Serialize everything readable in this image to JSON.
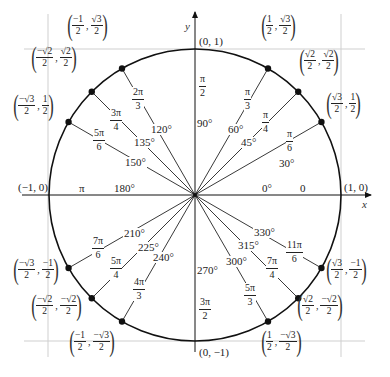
{
  "diagram": {
    "axes": {
      "x_label": "x",
      "y_label": "y"
    },
    "colors": {
      "stroke": "#111111",
      "guide": "#c8c8c8",
      "text": "#222222"
    },
    "geometry": {
      "center": [
        195,
        195
      ],
      "radius": 146
    },
    "axis_points": [
      {
        "id": "pos-x",
        "text": "(1, 0)"
      },
      {
        "id": "pos-y",
        "text": "(0, 1)"
      },
      {
        "id": "neg-x",
        "text": "(−1, 0)"
      },
      {
        "id": "neg-y",
        "text": "(0, −1)"
      }
    ],
    "axis_angles": [
      {
        "deg": "0°",
        "rad": "0"
      },
      {
        "deg": "90°",
        "rad_num": "π",
        "rad_den": "2"
      },
      {
        "deg": "180°",
        "rad": "π"
      },
      {
        "deg": "270°",
        "rad_num": "3π",
        "rad_den": "2"
      }
    ],
    "points": [
      {
        "deg": "30°",
        "rad_num": "π",
        "rad_den": "6",
        "x_num": "√3",
        "x_den": "2",
        "y_num": "1",
        "y_den": "2"
      },
      {
        "deg": "45°",
        "rad_num": "π",
        "rad_den": "4",
        "x_num": "√2",
        "x_den": "2",
        "y_num": "√2",
        "y_den": "2"
      },
      {
        "deg": "60°",
        "rad_num": "π",
        "rad_den": "3",
        "x_num": "1",
        "x_den": "2",
        "y_num": "√3",
        "y_den": "2"
      },
      {
        "deg": "120°",
        "rad_num": "2π",
        "rad_den": "3",
        "x_num": "−1",
        "x_den": "2",
        "y_num": "√3",
        "y_den": "2"
      },
      {
        "deg": "135°",
        "rad_num": "3π",
        "rad_den": "4",
        "x_num": "−√2",
        "x_den": "2",
        "y_num": "√2",
        "y_den": "2"
      },
      {
        "deg": "150°",
        "rad_num": "5π",
        "rad_den": "6",
        "x_num": "−√3",
        "x_den": "2",
        "y_num": "1",
        "y_den": "2"
      },
      {
        "deg": "210°",
        "rad_num": "7π",
        "rad_den": "6",
        "x_num": "−√3",
        "x_den": "2",
        "y_num": "−1",
        "y_den": "2"
      },
      {
        "deg": "225°",
        "rad_num": "5π",
        "rad_den": "4",
        "x_num": "−√2",
        "x_den": "2",
        "y_num": "−√2",
        "y_den": "2"
      },
      {
        "deg": "240°",
        "rad_num": "4π",
        "rad_den": "3",
        "x_num": "−1",
        "x_den": "2",
        "y_num": "−√3",
        "y_den": "2"
      },
      {
        "deg": "300°",
        "rad_num": "5π",
        "rad_den": "3",
        "x_num": "1",
        "x_den": "2",
        "y_num": "−√3",
        "y_den": "2"
      },
      {
        "deg": "315°",
        "rad_num": "7π",
        "rad_den": "4",
        "x_num": "√2",
        "x_den": "2",
        "y_num": "−√2",
        "y_den": "2"
      },
      {
        "deg": "330°",
        "rad_num": "11π",
        "rad_den": "6",
        "x_num": "√3",
        "x_den": "2",
        "y_num": "−1",
        "y_den": "2"
      }
    ]
  }
}
